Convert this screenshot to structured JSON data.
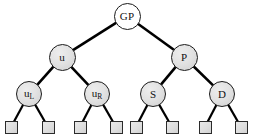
{
  "figure": {
    "kind": "binary-tree-diagram",
    "width": 255,
    "height": 136,
    "background_color": "#ffffff"
  },
  "style": {
    "node_fill": "#e2e2e2",
    "root_fill": "#ffffff",
    "node_stroke": "#1a1a1a",
    "edge_color": "#000000",
    "leaf_fill": "#dedede",
    "leaf_stroke": "#2b2b2b",
    "label_color": "#111111"
  },
  "nodes": [
    {
      "id": "GP",
      "label": "GP",
      "sub": "",
      "cx": 127,
      "cy": 16,
      "r": 13.5,
      "level": 1,
      "fill": "root"
    },
    {
      "id": "u",
      "label": "u",
      "sub": "",
      "cx": 62,
      "cy": 57,
      "r": 13.5,
      "level": 2,
      "fill": "internal"
    },
    {
      "id": "P",
      "label": "P",
      "sub": "",
      "cx": 184,
      "cy": 57,
      "r": 13.5,
      "level": 2,
      "fill": "internal"
    },
    {
      "id": "uL",
      "label": "u",
      "sub": "L",
      "cx": 29,
      "cy": 94,
      "r": 13.0,
      "level": 3,
      "fill": "internal"
    },
    {
      "id": "uR",
      "label": "u",
      "sub": "R",
      "cx": 97,
      "cy": 94,
      "r": 13.0,
      "level": 3,
      "fill": "internal"
    },
    {
      "id": "S",
      "label": "S",
      "sub": "",
      "cx": 153,
      "cy": 94,
      "r": 13.0,
      "level": 3,
      "fill": "internal"
    },
    {
      "id": "D",
      "label": "D",
      "sub": "",
      "cx": 222,
      "cy": 94,
      "r": 13.0,
      "level": 3,
      "fill": "internal"
    }
  ],
  "leaves": [
    {
      "id": "leaf1",
      "cx": 11,
      "cy": 127,
      "size": 13,
      "parent": "uL"
    },
    {
      "id": "leaf2",
      "cx": 48,
      "cy": 127,
      "size": 13,
      "parent": "uL"
    },
    {
      "id": "leaf3",
      "cx": 80,
      "cy": 127,
      "size": 13,
      "parent": "uR"
    },
    {
      "id": "leaf4",
      "cx": 116,
      "cy": 127,
      "size": 13,
      "parent": "uR"
    },
    {
      "id": "leaf5",
      "cx": 136,
      "cy": 127,
      "size": 13,
      "parent": "S"
    },
    {
      "id": "leaf6",
      "cx": 172,
      "cy": 127,
      "size": 13,
      "parent": "S"
    },
    {
      "id": "leaf7",
      "cx": 205,
      "cy": 127,
      "size": 13,
      "parent": "D"
    },
    {
      "id": "leaf8",
      "cx": 241,
      "cy": 127,
      "size": 13,
      "parent": "D"
    }
  ],
  "edges": [
    {
      "from": "GP",
      "to": "u",
      "width": 2.6
    },
    {
      "from": "GP",
      "to": "P",
      "width": 2.6
    },
    {
      "from": "u",
      "to": "uL",
      "width": 2.6
    },
    {
      "from": "u",
      "to": "uR",
      "width": 2.6
    },
    {
      "from": "P",
      "to": "S",
      "width": 2.6
    },
    {
      "from": "P",
      "to": "D",
      "width": 2.6
    },
    {
      "from": "uL",
      "to": "leaf1",
      "width": 2.2
    },
    {
      "from": "uL",
      "to": "leaf2",
      "width": 2.2
    },
    {
      "from": "uR",
      "to": "leaf3",
      "width": 2.2
    },
    {
      "from": "uR",
      "to": "leaf4",
      "width": 2.2
    },
    {
      "from": "S",
      "to": "leaf5",
      "width": 2.2
    },
    {
      "from": "S",
      "to": "leaf6",
      "width": 2.2
    },
    {
      "from": "D",
      "to": "leaf7",
      "width": 2.2
    },
    {
      "from": "D",
      "to": "leaf8",
      "width": 2.2
    }
  ]
}
